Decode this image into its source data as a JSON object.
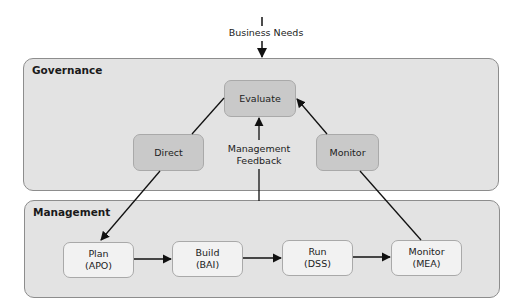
{
  "diagram": {
    "input_label": "Business Needs",
    "governance": {
      "title": "Governance",
      "nodes": {
        "evaluate": "Evaluate",
        "direct": "Direct",
        "monitor": "Monitor"
      },
      "feedback_label_line1": "Management",
      "feedback_label_line2": "Feedback"
    },
    "management": {
      "title": "Management",
      "nodes": [
        {
          "name": "Plan",
          "code": "(APO)"
        },
        {
          "name": "Build",
          "code": "(BAI)"
        },
        {
          "name": "Run",
          "code": "(DSS)"
        },
        {
          "name": "Monitor",
          "code": "(MEA)"
        }
      ]
    },
    "colors": {
      "panel_fill": "#e3e3e3",
      "governance_node_fill": "#c9c9c9",
      "management_node_fill": "#f2f2f2",
      "arrow": "#111111"
    },
    "edges": [
      [
        "Business Needs",
        "Evaluate"
      ],
      [
        "Evaluate",
        "Direct"
      ],
      [
        "Direct",
        "Plan (APO)"
      ],
      [
        "Plan (APO)",
        "Build (BAI)"
      ],
      [
        "Build (BAI)",
        "Run (DSS)"
      ],
      [
        "Run (DSS)",
        "Monitor (MEA)"
      ],
      [
        "Monitor (MEA)",
        "Monitor"
      ],
      [
        "Monitor",
        "Evaluate"
      ],
      [
        "Management",
        "Evaluate"
      ]
    ]
  }
}
